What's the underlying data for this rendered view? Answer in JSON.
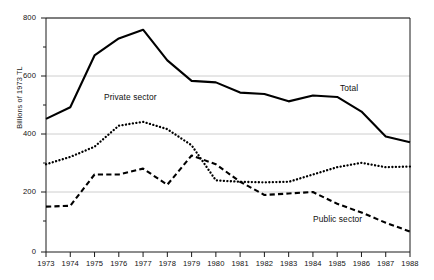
{
  "chart_data": {
    "type": "line",
    "title": "",
    "subtitle": "",
    "xlabel": "",
    "ylabel": "Billions of 1973 TL",
    "x": [
      1973,
      1974,
      1975,
      1976,
      1977,
      1978,
      1979,
      1980,
      1981,
      1982,
      1983,
      1984,
      1985,
      1986,
      1987,
      1988
    ],
    "categories": [
      "1973",
      "1974",
      "1975",
      "1976",
      "1977",
      "1978",
      "1979",
      "1980",
      "1981",
      "1982",
      "1983",
      "1984",
      "1985",
      "1986",
      "1987",
      "1988"
    ],
    "xlim": [
      1973,
      1988
    ],
    "ylim": [
      0,
      800
    ],
    "yticks": [
      0,
      200,
      400,
      600,
      800
    ],
    "ytick_labels": [
      "0",
      "200",
      "400",
      "600",
      "800"
    ],
    "grid": "horizontal",
    "grid_color": "#bfbfbf",
    "legend_position": "inline-annotations",
    "series": [
      {
        "name": "Total",
        "style": "solid",
        "color": "#000000",
        "width": 2.1,
        "label_x": 1987.1,
        "label_y": 525,
        "values": [
          455,
          495,
          672,
          730,
          760,
          655,
          585,
          580,
          545,
          540,
          515,
          535,
          530,
          480,
          395,
          375
        ]
      },
      {
        "name": "Private sector",
        "style": "dotted",
        "color": "#000000",
        "width": 2.3,
        "label_x": 1975.7,
        "label_y": 490,
        "values": [
          300,
          325,
          360,
          432,
          445,
          420,
          365,
          245,
          240,
          238,
          240,
          265,
          290,
          305,
          290,
          292
        ]
      },
      {
        "name": "Public sector",
        "style": "dashed",
        "color": "#000000",
        "width": 2.1,
        "label_x": 1986.0,
        "label_y": 128,
        "values": [
          155,
          158,
          265,
          265,
          285,
          230,
          330,
          300,
          240,
          195,
          200,
          205,
          165,
          135,
          100,
          70
        ]
      }
    ],
    "annotations": [
      {
        "text": "Total",
        "x_px": 340,
        "y_px": 89
      },
      {
        "text": "Private sector",
        "x_px": 104,
        "y_px": 98
      },
      {
        "text": "Public sector",
        "x_px": 313,
        "y_px": 220
      }
    ]
  },
  "axis": {
    "y_title": "Billions of 1973 TL",
    "y_ticks": [
      "800",
      "600",
      "400",
      "200",
      "0"
    ],
    "x_ticks": [
      "1973",
      "1974",
      "1975",
      "1976",
      "1977",
      "1978",
      "1979",
      "1980",
      "1981",
      "1982",
      "1983",
      "1984",
      "1985",
      "1986",
      "1987",
      "1988"
    ]
  },
  "labels": {
    "total": "Total",
    "private": "Private sector",
    "public": "Public sector"
  }
}
